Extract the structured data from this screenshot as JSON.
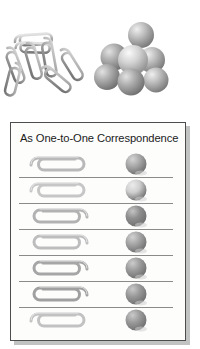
{
  "scene": {
    "title_text": "As One-to-One Correspondence",
    "background_color": "#ffffff",
    "card_background": "#fdfdfc",
    "card_border_color": "#4d4d4d",
    "card_shadow_color": "#8e8f90",
    "title_color": "#1b1b1b",
    "rule_color": "#8a8a8a"
  },
  "top_illustration": {
    "clip_pile": {
      "label": "paperclip-pile",
      "count": 7,
      "color_light": "#d8d8d8",
      "color_mid": "#a9a9a9",
      "color_dark": "#6e6e6e"
    },
    "sphere_pile": {
      "label": "sphere-pile",
      "count": 7,
      "color_light": "#e6e6e6",
      "color_mid": "#b4b4b4",
      "color_dark": "#7d7d7d"
    }
  },
  "card": {
    "title": "As One-to-One Correspondence",
    "rows": [
      {
        "index": 1,
        "clip_label": "paperclip",
        "clip_tone": "#b9b9b9",
        "clip_open_side": "right",
        "ball_label": "sphere",
        "ball_tone": "#a8a8a8",
        "ball_highlight": "#d5d5d5"
      },
      {
        "index": 2,
        "clip_label": "paperclip",
        "clip_tone": "#c6c6c6",
        "clip_open_side": "right",
        "ball_label": "sphere",
        "ball_tone": "#cfcfcf",
        "ball_highlight": "#ececec"
      },
      {
        "index": 3,
        "clip_label": "paperclip",
        "clip_tone": "#b2b2b2",
        "clip_open_side": "left",
        "ball_label": "sphere",
        "ball_tone": "#8f8f8f",
        "ball_highlight": "#c4c4c4"
      },
      {
        "index": 4,
        "clip_label": "paperclip",
        "clip_tone": "#bdbdbd",
        "clip_open_side": "left",
        "ball_label": "sphere",
        "ball_tone": "#a5a5a5",
        "ball_highlight": "#d2d2d2"
      },
      {
        "index": 5,
        "clip_label": "paperclip",
        "clip_tone": "#a6a6a6",
        "clip_open_side": "left",
        "ball_label": "sphere",
        "ball_tone": "#9d9d9d",
        "ball_highlight": "#cccccc"
      },
      {
        "index": 6,
        "clip_label": "paperclip",
        "clip_tone": "#a0a0a0",
        "clip_open_side": "left",
        "ball_label": "sphere",
        "ball_tone": "#9a9a9a",
        "ball_highlight": "#c9c9c9"
      },
      {
        "index": 7,
        "clip_label": "paperclip",
        "clip_tone": "#c2c2c2",
        "clip_open_side": "right",
        "ball_label": "sphere",
        "ball_tone": "#9b9b9b",
        "ball_highlight": "#cacaca"
      }
    ],
    "row_count": 7
  }
}
